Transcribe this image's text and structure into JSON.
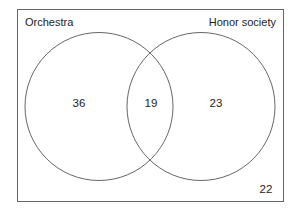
{
  "diagram": {
    "type": "venn",
    "sets": [
      {
        "label": "Orchestra",
        "only_count": "36"
      },
      {
        "label": "Honor society",
        "only_count": "23"
      }
    ],
    "intersection_count": "19",
    "outside_count": "22"
  },
  "colors": {
    "stroke": "#555555",
    "text": "#222222",
    "background": "#ffffff"
  }
}
